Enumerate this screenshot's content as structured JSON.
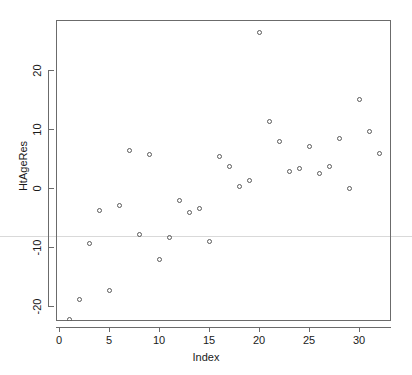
{
  "chart_data": {
    "type": "scatter",
    "title": "",
    "xlabel": "Index",
    "ylabel": "HtAgeRes",
    "xlim": [
      -0.3,
      33.2
    ],
    "ylim": [
      -23.0,
      27.8
    ],
    "xticks": [
      0,
      5,
      10,
      15,
      20,
      25,
      30
    ],
    "xticklabels": [
      "0",
      "5",
      "10",
      "15",
      "20",
      "25",
      "30"
    ],
    "yticks": [
      -20,
      -10,
      0,
      10,
      20
    ],
    "yticklabels": [
      "-20",
      "-10",
      "0",
      "10",
      "20"
    ],
    "grid": false,
    "legend": false,
    "marker": "open-circle",
    "marker_color": "#5a5a5a",
    "x": [
      1,
      2,
      3,
      4,
      5,
      6,
      7,
      8,
      9,
      10,
      11,
      12,
      13,
      14,
      15,
      16,
      17,
      18,
      19,
      20,
      21,
      22,
      23,
      24,
      25,
      26,
      27,
      28,
      29,
      30,
      31,
      32
    ],
    "y": [
      -22.3,
      -19.0,
      -9.4,
      -3.8,
      -17.5,
      -3.0,
      6.4,
      -7.9,
      5.7,
      -12.2,
      -8.4,
      -2.1,
      -4.1,
      -3.5,
      -9.1,
      5.3,
      3.6,
      0.2,
      1.3,
      26.4,
      11.3,
      7.9,
      2.8,
      3.3,
      7.0,
      2.5,
      3.6,
      8.5,
      -0.1,
      15.0,
      9.6,
      5.8
    ],
    "points": [
      {
        "index": 1,
        "value": -22.3
      },
      {
        "index": 2,
        "value": -19.0
      },
      {
        "index": 3,
        "value": -9.4
      },
      {
        "index": 4,
        "value": -3.8
      },
      {
        "index": 5,
        "value": -17.5
      },
      {
        "index": 6,
        "value": -3.0
      },
      {
        "index": 7,
        "value": 6.4
      },
      {
        "index": 8,
        "value": -7.9
      },
      {
        "index": 9,
        "value": 5.7
      },
      {
        "index": 10,
        "value": -12.2
      },
      {
        "index": 11,
        "value": -8.4
      },
      {
        "index": 12,
        "value": -2.1
      },
      {
        "index": 13,
        "value": -4.1
      },
      {
        "index": 14,
        "value": -3.5
      },
      {
        "index": 15,
        "value": -9.1
      },
      {
        "index": 16,
        "value": 5.3
      },
      {
        "index": 17,
        "value": 3.6
      },
      {
        "index": 18,
        "value": 0.2
      },
      {
        "index": 19,
        "value": 1.3
      },
      {
        "index": 20,
        "value": 26.4
      },
      {
        "index": 21,
        "value": 11.3
      },
      {
        "index": 22,
        "value": 7.9
      },
      {
        "index": 23,
        "value": 2.8
      },
      {
        "index": 24,
        "value": 3.3
      },
      {
        "index": 25,
        "value": 7.0
      },
      {
        "index": 26,
        "value": 2.5
      },
      {
        "index": 27,
        "value": 3.6
      },
      {
        "index": 28,
        "value": 8.5
      },
      {
        "index": 29,
        "value": -0.1
      },
      {
        "index": 30,
        "value": 15.0
      },
      {
        "index": 31,
        "value": 9.6
      },
      {
        "index": 32,
        "value": 5.8
      }
    ]
  },
  "axes": {
    "x_title": "Index",
    "y_title": "HtAgeRes"
  }
}
